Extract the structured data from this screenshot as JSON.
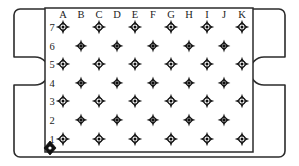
{
  "diagram": {
    "title": "Connector Pin Layout",
    "kind": "connector-pin-grid",
    "colors": {
      "outline": "#2b2b2b",
      "pin": "#1a1a1a",
      "background": "#ffffff",
      "marker": "#111111"
    },
    "shell": {
      "notch_left": "rounded-latch-recess",
      "notch_right": "rounded-latch-recess",
      "corner_style": "rounded"
    },
    "column_headers": [
      "A",
      "B",
      "C",
      "D",
      "E",
      "F",
      "G",
      "H",
      "I",
      "J",
      "K"
    ],
    "row_labels": [
      "7",
      "6",
      "5",
      "4",
      "3",
      "2",
      "1"
    ],
    "grid": {
      "columns": 11,
      "rows": 7,
      "pattern": "staggered",
      "odd_row_columns": [
        "A",
        "C",
        "E",
        "G",
        "I",
        "K"
      ],
      "even_row_columns": [
        "B",
        "D",
        "F",
        "H",
        "J"
      ],
      "total_pins": 59
    },
    "rows": [
      {
        "label": "7",
        "pins": [
          "A",
          "C",
          "E",
          "G",
          "I",
          "K"
        ]
      },
      {
        "label": "6",
        "pins": [
          "B",
          "D",
          "F",
          "H",
          "J"
        ]
      },
      {
        "label": "5",
        "pins": [
          "A",
          "C",
          "E",
          "G",
          "I",
          "K"
        ]
      },
      {
        "label": "4",
        "pins": [
          "B",
          "D",
          "F",
          "H",
          "J"
        ]
      },
      {
        "label": "3",
        "pins": [
          "A",
          "C",
          "E",
          "G",
          "I",
          "K"
        ]
      },
      {
        "label": "2",
        "pins": [
          "B",
          "D",
          "F",
          "H",
          "J"
        ]
      },
      {
        "label": "1",
        "pins": [
          "A",
          "C",
          "E",
          "G",
          "I",
          "K"
        ]
      }
    ],
    "marker": {
      "name": "pin-one-indicator",
      "shape": "diamond",
      "position": "bottom-left",
      "near_pin": "A1"
    },
    "geometry": {
      "width": 299,
      "height": 166,
      "shell_left": 14,
      "shell_right": 285,
      "shell_top": 9,
      "shell_bottom": 157,
      "field_left": 45,
      "field_right": 253,
      "field_top": 8,
      "field_bottom": 152,
      "col_x": [
        63,
        81,
        99,
        117,
        135,
        153,
        171,
        189,
        207,
        224,
        242
      ],
      "row_y": [
        27,
        46,
        64,
        83,
        101,
        120,
        139
      ],
      "header_y": 18,
      "row_label_x": 52
    }
  }
}
